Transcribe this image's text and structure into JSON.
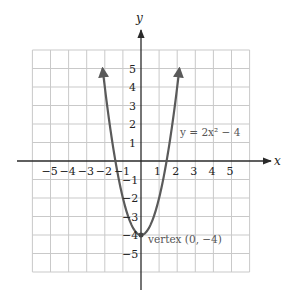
{
  "chart_data": {
    "type": "line",
    "title": "",
    "function": "y = 2x^2 - 4",
    "xlabel": "x",
    "ylabel": "y",
    "xlim": [
      -6,
      6
    ],
    "ylim": [
      -6,
      6
    ],
    "grid": true,
    "x_ticks": [
      -5,
      -4,
      -3,
      -2,
      -1,
      1,
      2,
      3,
      4,
      5
    ],
    "y_ticks": [
      -5,
      -4,
      -3,
      -2,
      -1,
      1,
      2,
      3,
      4,
      5
    ],
    "x_tick_labels": [
      "−5",
      "−4",
      "−3",
      "−2",
      "−1",
      "1",
      "2",
      "3",
      "4",
      "5"
    ],
    "y_tick_labels": [
      "−5",
      "−4",
      "−3",
      "−2",
      "−1",
      "1",
      "2",
      "3",
      "4",
      "5"
    ],
    "series": [
      {
        "name": "y = 2x² − 4",
        "color": "#5a5a5a",
        "domain": [
          -2.12,
          2.12
        ],
        "arrow_ends": true
      }
    ],
    "annotations": [
      {
        "text": "y = 2x² − 4",
        "x": 2.6,
        "y": 1.2
      },
      {
        "text": "vertex (0, −4)",
        "x": 0.35,
        "y": -4.2,
        "point": [
          0,
          -4
        ]
      }
    ]
  }
}
